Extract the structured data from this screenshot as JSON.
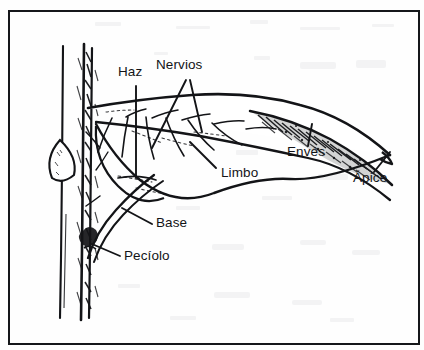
{
  "figure": {
    "kind": "botanical-diagram",
    "language": "es",
    "frame": {
      "border_color": "#15171a",
      "background": "#fefefe"
    },
    "ink_color": "#131417"
  },
  "labels": [
    {
      "id": "haz",
      "text": "Haz",
      "x": 118,
      "y": 72,
      "points_to": "upper leaf surface"
    },
    {
      "id": "nervios",
      "text": "Nervios",
      "x": 158,
      "y": 65,
      "points_to": "leaf veins"
    },
    {
      "id": "limbo",
      "text": "Limbo",
      "x": 221,
      "y": 172,
      "points_to": "leaf blade"
    },
    {
      "id": "enves",
      "text": "Envés",
      "x": 288,
      "y": 151,
      "points_to": "lower leaf surface"
    },
    {
      "id": "apice",
      "text": "Ápice",
      "x": 355,
      "y": 177,
      "points_to": "leaf tip"
    },
    {
      "id": "base",
      "text": "Base",
      "x": 157,
      "y": 222,
      "points_to": "leaf base"
    },
    {
      "id": "peciolo",
      "text": "Pecíolo",
      "x": 124,
      "y": 255,
      "points_to": "leaf stalk"
    }
  ],
  "parts": [
    {
      "id": "stem",
      "name": "tallo"
    },
    {
      "id": "bud",
      "name": "yema"
    },
    {
      "id": "petiole",
      "name": "pecíolo"
    },
    {
      "id": "blade",
      "name": "limbo"
    },
    {
      "id": "midrib",
      "name": "nervio central"
    },
    {
      "id": "veins",
      "name": "nervios secundarios"
    },
    {
      "id": "underside",
      "name": "envés (zona sombreada)"
    },
    {
      "id": "apex",
      "name": "ápice"
    }
  ]
}
